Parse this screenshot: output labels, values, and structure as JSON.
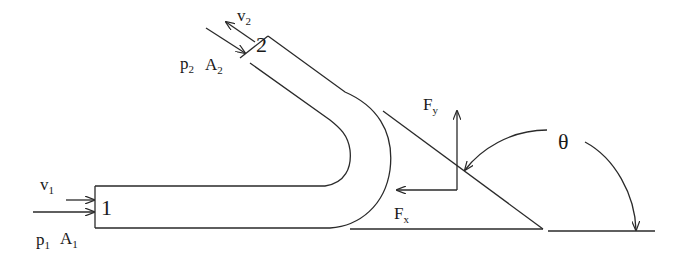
{
  "diagram": {
    "type": "pipe-bend-force-diagram",
    "colors": {
      "stroke": "#2a2a2a",
      "background": "#ffffff"
    },
    "labels": {
      "v1": {
        "base": "v",
        "sub": "1"
      },
      "p1": {
        "base": "p",
        "sub": "1"
      },
      "A1": {
        "base": "A",
        "sub": "1"
      },
      "v2": {
        "base": "v",
        "sub": "2"
      },
      "p2": {
        "base": "p",
        "sub": "2"
      },
      "A2": {
        "base": "A",
        "sub": "2"
      },
      "section1": "1",
      "section2": "2",
      "Fx": {
        "base": "F",
        "sub": "x"
      },
      "Fy": {
        "base": "F",
        "sub": "y"
      },
      "theta": "θ"
    }
  }
}
